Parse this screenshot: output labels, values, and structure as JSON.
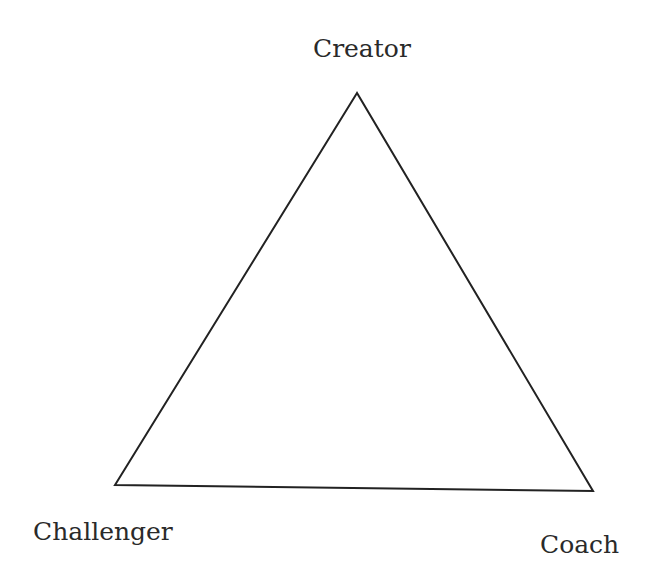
{
  "diagram": {
    "type": "triangle",
    "vertices": {
      "top": {
        "label": "Creator"
      },
      "bottom_left": {
        "label": "Challenger"
      },
      "bottom_right": {
        "label": "Coach"
      }
    },
    "stroke_color": "#222222",
    "text_color": "#2a2a2a"
  }
}
